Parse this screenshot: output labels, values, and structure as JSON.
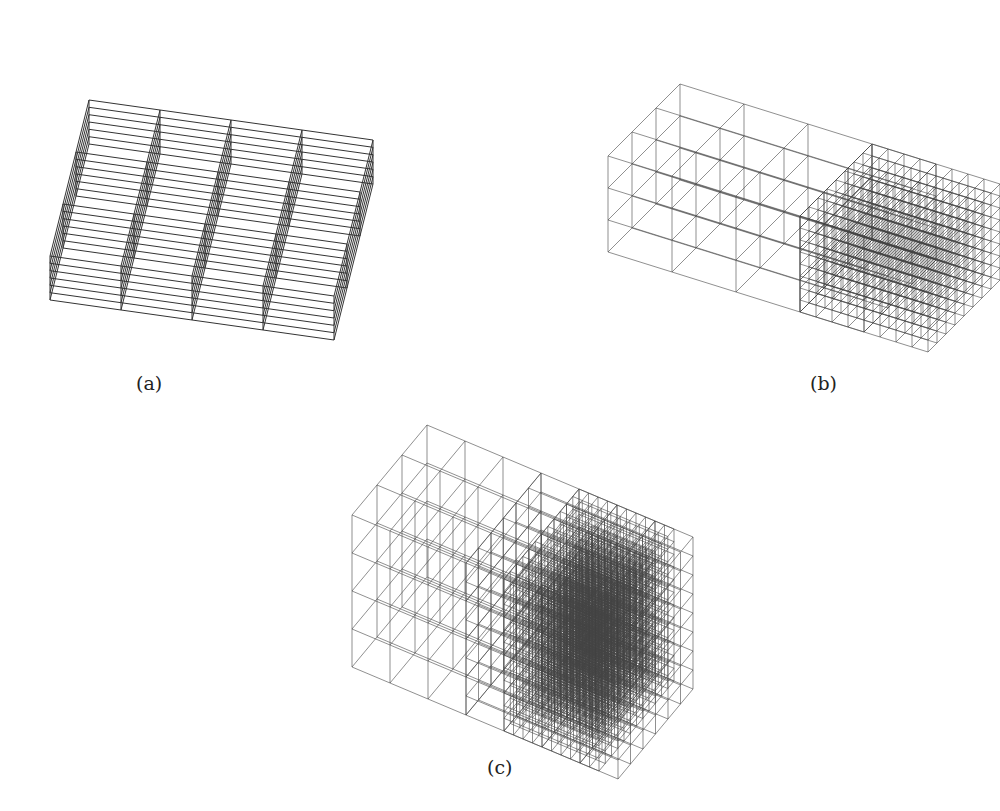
{
  "figure": {
    "panels": [
      {
        "id": "a",
        "caption": "(a)",
        "description": "Uniform coarse octree grid, 4 columns with many horizontal slabs"
      },
      {
        "id": "b",
        "caption": "(b)",
        "description": "Adaptive grid with one level of refinement on the right region"
      },
      {
        "id": "c",
        "caption": "(c)",
        "description": "Adaptive grid with multiple refinement levels, dense diagonal band"
      }
    ]
  }
}
